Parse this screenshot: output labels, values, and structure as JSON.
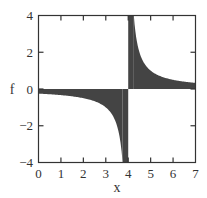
{
  "chart_data": {
    "type": "area",
    "title": "",
    "xlabel": "x",
    "ylabel": "f",
    "xlim": [
      0,
      7
    ],
    "ylim": [
      -4,
      4
    ],
    "xticks": [
      "0",
      "1",
      "2",
      "3",
      "4",
      "5",
      "6",
      "7"
    ],
    "yticks": [
      "-4",
      "-2",
      "0",
      "2",
      "4"
    ],
    "grid": false,
    "legend": null,
    "series": [
      {
        "name": "f = 1/(x-4) (shaded to f=0)",
        "color": "#444444",
        "x": [
          0,
          1,
          2,
          3,
          3.5,
          3.75,
          3.9,
          4.0,
          4.1,
          4.25,
          4.5,
          5,
          6,
          7
        ],
        "values": [
          -0.25,
          -0.33,
          -0.5,
          -1.0,
          -2.0,
          -4.0,
          -4.0,
          4.0,
          4.0,
          4.0,
          2.0,
          1.0,
          0.5,
          0.33
        ]
      }
    ]
  },
  "labels": {
    "x_axis": "x",
    "y_axis": "f",
    "x_ticks": [
      "0",
      "1",
      "2",
      "3",
      "4",
      "5",
      "6",
      "7"
    ],
    "y_ticks": [
      "4",
      "2",
      "0",
      "−2",
      "−4"
    ]
  }
}
